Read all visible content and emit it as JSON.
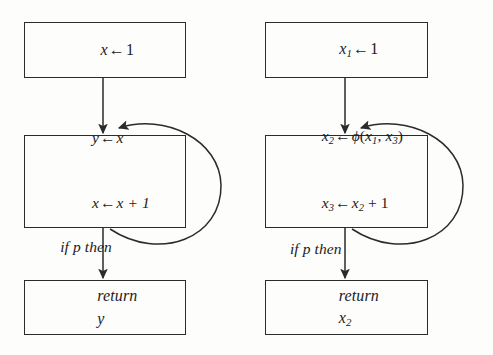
{
  "figure": {
    "kind": "control-flow-graph-pair",
    "background_color": "#fdfdfb",
    "line_color": "#2b2b2b",
    "text_color": "#1b1b1b"
  },
  "graphs": [
    {
      "id": "original",
      "name": "original-cfg",
      "nodes": [
        {
          "id": "entry-left",
          "name": "entry-block",
          "lines": [
            "x ← 1"
          ]
        },
        {
          "id": "loop-left",
          "name": "loop-body-block",
          "lines": [
            "y ← x",
            "x ← x + 1",
            "if p then"
          ]
        },
        {
          "id": "return-left",
          "name": "return-block",
          "lines": [
            "return y"
          ]
        }
      ],
      "edges": [
        {
          "name": "entry-to-loop",
          "from": "entry-left",
          "to": "loop-left",
          "style": "straight-down"
        },
        {
          "name": "loop-back-edge",
          "from": "loop-left",
          "to": "loop-left",
          "style": "arc-right"
        },
        {
          "name": "loop-to-return",
          "from": "loop-left",
          "to": "return-left",
          "style": "straight-down"
        }
      ]
    },
    {
      "id": "ssa",
      "name": "ssa-cfg",
      "nodes": [
        {
          "id": "entry-right",
          "name": "entry-block",
          "lines": [
            "x₁ ← 1"
          ]
        },
        {
          "id": "loop-right",
          "name": "loop-body-block",
          "lines": [
            "x₂ ← ϕ(x₁, x₃)",
            "x₃ ← x₂ + 1",
            "if p then"
          ]
        },
        {
          "id": "return-right",
          "name": "return-block",
          "lines": [
            "return x₂"
          ]
        }
      ],
      "edges": [
        {
          "name": "entry-to-loop",
          "from": "entry-right",
          "to": "loop-right",
          "style": "straight-down"
        },
        {
          "name": "loop-back-edge",
          "from": "loop-right",
          "to": "loop-right",
          "style": "arc-right"
        },
        {
          "name": "loop-to-return",
          "from": "loop-right",
          "to": "return-right",
          "style": "straight-down"
        }
      ]
    }
  ],
  "text": {
    "left": {
      "entry": {
        "var": "x",
        "arrow": "←",
        "value": "1"
      },
      "loop": {
        "line1": {
          "lhs": "y",
          "arrow": "←",
          "rhs": "x"
        },
        "line2": {
          "lhs": "x",
          "arrow": "←",
          "rhs": "x + 1"
        },
        "line3": "if p then"
      },
      "return": {
        "keyword": "return",
        "value": "y"
      }
    },
    "right": {
      "entry": {
        "var": "x",
        "sub": "1",
        "arrow": "←",
        "value": "1"
      },
      "loop": {
        "line1": {
          "lhs": "x",
          "lhs_sub": "2",
          "arrow": "←",
          "fn": "ϕ",
          "open": "(",
          "arg1": "x",
          "arg1_sub": "1",
          "comma": ", ",
          "arg2": "x",
          "arg2_sub": "3",
          "close": ")"
        },
        "line2": {
          "lhs": "x",
          "lhs_sub": "3",
          "arrow": "←",
          "rhs": "x",
          "rhs_sub": "2",
          "tail": " + 1"
        },
        "line3": "if p then"
      },
      "return": {
        "keyword": "return",
        "value": "x",
        "sub": "2"
      }
    }
  }
}
